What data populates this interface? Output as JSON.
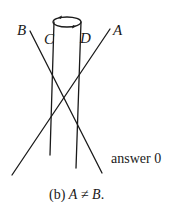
{
  "figure": {
    "labels": {
      "A": "A",
      "B": "B",
      "C": "C",
      "D": "D"
    },
    "annotation": "answer 0",
    "caption_prefix": "(b) ",
    "caption_A": "A",
    "caption_neq": " ≠ ",
    "caption_B": "B",
    "caption_suffix": "."
  },
  "geometry": {
    "intersection": [
      65,
      97
    ],
    "line_A": [
      [
        110,
        29
      ],
      [
        12,
        175
      ]
    ],
    "line_B": [
      [
        30,
        31
      ],
      [
        102,
        173
      ]
    ],
    "line_C": [
      [
        54,
        22
      ],
      [
        50,
        155
      ]
    ],
    "line_D": [
      [
        81,
        22
      ],
      [
        76,
        168
      ]
    ],
    "rotation_ellipse": {
      "cx": 67,
      "cy": 22,
      "rx": 14,
      "ry": 5
    }
  }
}
